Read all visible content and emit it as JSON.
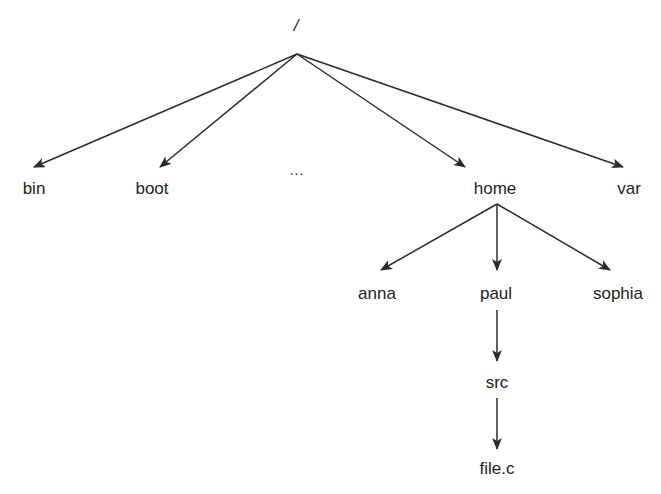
{
  "diagram": {
    "type": "directory-tree",
    "root": {
      "label": "/",
      "x": 296,
      "y": 16
    },
    "nodes": [
      {
        "id": "bin",
        "label": "bin",
        "x": 34,
        "y": 179
      },
      {
        "id": "boot",
        "label": "boot",
        "x": 152,
        "y": 179
      },
      {
        "id": "more",
        "label": "...",
        "x": 297,
        "y": 160
      },
      {
        "id": "home",
        "label": "home",
        "x": 495,
        "y": 179
      },
      {
        "id": "var",
        "label": "var",
        "x": 629,
        "y": 179
      },
      {
        "id": "anna",
        "label": "anna",
        "x": 377,
        "y": 284
      },
      {
        "id": "paul",
        "label": "paul",
        "x": 496,
        "y": 284
      },
      {
        "id": "sophia",
        "label": "sophia",
        "x": 618,
        "y": 284
      },
      {
        "id": "src",
        "label": "src",
        "x": 497,
        "y": 373
      },
      {
        "id": "filec",
        "label": "file.c",
        "x": 497,
        "y": 459
      }
    ],
    "edges": [
      {
        "from": "/",
        "to": "bin",
        "x1": 297,
        "y1": 54,
        "x2": 34,
        "y2": 167
      },
      {
        "from": "/",
        "to": "boot",
        "x1": 297,
        "y1": 54,
        "x2": 160,
        "y2": 167
      },
      {
        "from": "/",
        "to": "home",
        "x1": 297,
        "y1": 54,
        "x2": 465,
        "y2": 167
      },
      {
        "from": "/",
        "to": "var",
        "x1": 297,
        "y1": 54,
        "x2": 623,
        "y2": 167
      },
      {
        "from": "home",
        "to": "anna",
        "x1": 497,
        "y1": 204,
        "x2": 381,
        "y2": 270
      },
      {
        "from": "home",
        "to": "paul",
        "x1": 497,
        "y1": 204,
        "x2": 497,
        "y2": 270
      },
      {
        "from": "home",
        "to": "sophia",
        "x1": 497,
        "y1": 204,
        "x2": 610,
        "y2": 270
      },
      {
        "from": "paul",
        "to": "src",
        "x1": 497,
        "y1": 310,
        "x2": 497,
        "y2": 361
      },
      {
        "from": "src",
        "to": "file.c",
        "x1": 497,
        "y1": 398,
        "x2": 497,
        "y2": 449
      }
    ],
    "colors": {
      "background": "#ffffff",
      "line": "#2b2b2b",
      "text": "#1e1e1e"
    }
  }
}
